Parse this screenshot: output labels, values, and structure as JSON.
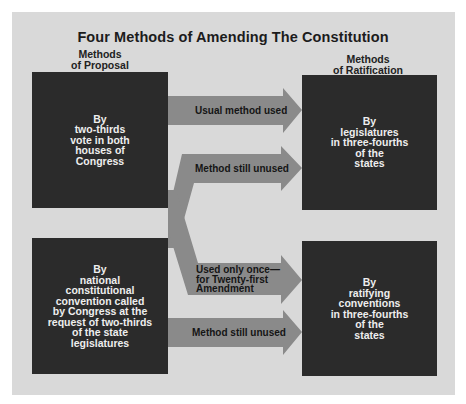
{
  "title": "Four Methods of Amending The Constitution",
  "columns": {
    "proposal": {
      "line1": "Methods",
      "line2": "of Proposal"
    },
    "ratification": {
      "line1": "Methods",
      "line2": "of Ratification"
    }
  },
  "proposal_methods": [
    {
      "text": "By\ntwo-thirds\nvote in both\nhouses of\nCongress"
    },
    {
      "text": "By\nnational\nconstitutional\nconvention called\nby Congress at the\nrequest of two-thirds\nof the state\nlegislatures"
    }
  ],
  "ratification_methods": [
    {
      "text": "By\nlegislatures\nin three-fourths\nof the\nstates"
    },
    {
      "text": "By\nratifying\nconventions\nin three-fourths\nof the\nstates"
    }
  ],
  "arrows": [
    {
      "label": "Usual method used",
      "from": "Congress two-thirds vote",
      "to": "State legislatures"
    },
    {
      "label": "Method still unused",
      "from": "National convention",
      "to": "State legislatures"
    },
    {
      "label": "Used only once—\nfor Twenty-first\nAmendment",
      "from": "Congress two-thirds vote",
      "to": "Ratifying conventions"
    },
    {
      "label": "Method still unused",
      "from": "National convention",
      "to": "Ratifying conventions"
    }
  ],
  "colors": {
    "panel": "#d9d9d9",
    "box": "#2b2b2b",
    "arrow": "#8a8a8a",
    "title": "#1c1c1c"
  }
}
